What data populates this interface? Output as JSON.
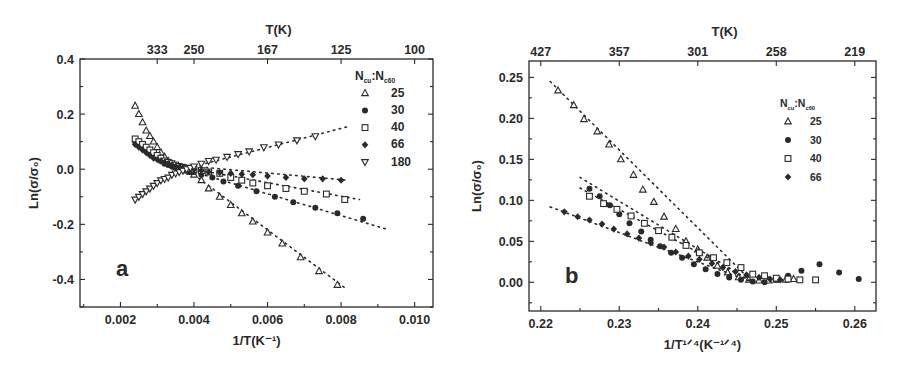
{
  "chart_data": [
    {
      "panel": "a",
      "type": "scatter",
      "panel_label": "a",
      "xlabel": "1/T(K⁻¹)",
      "ylabel": "Ln(σ/σ₀)",
      "top_axis_label": "T(K)",
      "xlim": [
        0.0009,
        0.0105
      ],
      "ylim": [
        -0.5,
        0.4
      ],
      "xticks": [
        0.002,
        0.004,
        0.006,
        0.008,
        0.01
      ],
      "xtick_labels": [
        "0.002",
        "0.004",
        "0.006",
        "0.008",
        "0.010"
      ],
      "yticks": [
        -0.4,
        -0.2,
        0.0,
        0.2,
        0.4
      ],
      "ytick_labels": [
        "-0.4",
        "-0.2",
        "0.0",
        "0.2",
        "0.4"
      ],
      "top_ticks": [
        0.003,
        0.004,
        0.006,
        0.008,
        0.01
      ],
      "top_tick_labels": [
        "333",
        "250",
        "167",
        "125",
        "100"
      ],
      "grid": false,
      "legend_title": "Nₑᵤ:Nₑ₆₀",
      "legend_position": "upper right",
      "series": [
        {
          "name": "25",
          "marker": "triangle-up-open",
          "x": [
            0.0024,
            0.0025,
            0.0026,
            0.0027,
            0.0028,
            0.0029,
            0.003,
            0.0031,
            0.0032,
            0.0033,
            0.0034,
            0.0035,
            0.0036,
            0.0037,
            0.0038,
            0.0039,
            0.004,
            0.0042,
            0.0044,
            0.0047,
            0.005,
            0.0053,
            0.0056,
            0.006,
            0.0064,
            0.0069,
            0.0074,
            0.0079
          ],
          "y": [
            0.23,
            0.2,
            0.17,
            0.14,
            0.12,
            0.1,
            0.08,
            0.06,
            0.045,
            0.03,
            0.02,
            0.01,
            0.005,
            0.0,
            -0.005,
            -0.01,
            -0.02,
            -0.04,
            -0.07,
            -0.1,
            -0.13,
            -0.16,
            -0.19,
            -0.23,
            -0.27,
            -0.32,
            -0.37,
            -0.42
          ],
          "fit_line": [
            [
              0.004,
              -0.02
            ],
            [
              0.0081,
              -0.43
            ]
          ]
        },
        {
          "name": "30",
          "marker": "circle-filled",
          "x": [
            0.0024,
            0.0025,
            0.0026,
            0.0027,
            0.0028,
            0.0029,
            0.003,
            0.0031,
            0.0032,
            0.0033,
            0.0034,
            0.0035,
            0.0036,
            0.0037,
            0.0038,
            0.0039,
            0.004,
            0.0042,
            0.0045,
            0.0048,
            0.0052,
            0.0057,
            0.0062,
            0.0067,
            0.0073,
            0.0079,
            0.0086
          ],
          "y": [
            0.1,
            0.09,
            0.08,
            0.07,
            0.06,
            0.05,
            0.04,
            0.03,
            0.02,
            0.015,
            0.01,
            0.005,
            0.0,
            -0.002,
            -0.005,
            -0.008,
            -0.01,
            -0.02,
            -0.03,
            -0.045,
            -0.06,
            -0.08,
            -0.1,
            -0.12,
            -0.14,
            -0.16,
            -0.18
          ],
          "fit_line": [
            [
              0.004,
              -0.01
            ],
            [
              0.0093,
              -0.22
            ]
          ]
        },
        {
          "name": "40",
          "marker": "square-open",
          "x": [
            0.0024,
            0.0025,
            0.0026,
            0.0027,
            0.0028,
            0.0029,
            0.003,
            0.0031,
            0.0032,
            0.0033,
            0.0034,
            0.0035,
            0.0036,
            0.0037,
            0.0038,
            0.0039,
            0.004,
            0.0042,
            0.0044,
            0.0047,
            0.005,
            0.0053,
            0.0056,
            0.006,
            0.0065,
            0.007,
            0.0076,
            0.0081
          ],
          "y": [
            0.11,
            0.1,
            0.09,
            0.08,
            0.07,
            0.06,
            0.05,
            0.04,
            0.03,
            0.025,
            0.02,
            0.015,
            0.01,
            0.007,
            0.004,
            0.002,
            0.0,
            -0.005,
            -0.01,
            -0.015,
            -0.03,
            -0.04,
            -0.05,
            -0.06,
            -0.07,
            -0.08,
            -0.09,
            -0.11
          ],
          "fit_line": [
            [
              0.004,
              0.0
            ],
            [
              0.0085,
              -0.11
            ]
          ]
        },
        {
          "name": "66",
          "marker": "diamond-filled",
          "x": [
            0.0024,
            0.0025,
            0.0026,
            0.0027,
            0.0028,
            0.0029,
            0.003,
            0.0031,
            0.0032,
            0.0033,
            0.0034,
            0.0035,
            0.0036,
            0.0037,
            0.0038,
            0.0039,
            0.004,
            0.0042,
            0.0044,
            0.0047,
            0.005,
            0.0053,
            0.0056,
            0.006,
            0.0065,
            0.007,
            0.0075,
            0.008
          ],
          "y": [
            0.09,
            0.08,
            0.07,
            0.06,
            0.05,
            0.04,
            0.035,
            0.03,
            0.025,
            0.02,
            0.015,
            0.01,
            0.008,
            0.006,
            0.004,
            0.002,
            0.0,
            -0.005,
            -0.01,
            -0.012,
            -0.015,
            -0.018,
            -0.02,
            -0.025,
            -0.03,
            -0.035,
            -0.035,
            -0.04
          ],
          "fit_line": [
            [
              0.004,
              0.01
            ],
            [
              0.0082,
              -0.04
            ]
          ]
        },
        {
          "name": "180",
          "marker": "triangle-down-open",
          "x": [
            0.0024,
            0.0025,
            0.0026,
            0.0027,
            0.0028,
            0.0029,
            0.003,
            0.0031,
            0.0032,
            0.0033,
            0.0034,
            0.0035,
            0.0036,
            0.0037,
            0.0038,
            0.0039,
            0.004,
            0.0042,
            0.0044,
            0.0046,
            0.0049,
            0.0052,
            0.0055,
            0.0059,
            0.0063,
            0.0068,
            0.0073
          ],
          "y": [
            -0.11,
            -0.1,
            -0.09,
            -0.08,
            -0.07,
            -0.06,
            -0.05,
            -0.04,
            -0.035,
            -0.03,
            -0.02,
            -0.015,
            -0.01,
            -0.005,
            0.0,
            0.005,
            0.01,
            0.02,
            0.03,
            0.035,
            0.045,
            0.055,
            0.065,
            0.08,
            0.09,
            0.105,
            0.12
          ],
          "fit_line": [
            [
              0.004,
              0.01
            ],
            [
              0.0082,
              0.155
            ]
          ]
        }
      ]
    },
    {
      "panel": "b",
      "type": "scatter",
      "panel_label": "b",
      "xlabel": "1/T¹ᐟ⁴(K⁻¹ᐟ⁴)",
      "ylabel": "Ln(σ/σ₀)",
      "top_axis_label": "T(K)",
      "xlim": [
        0.2185,
        0.2627
      ],
      "ylim": [
        -0.035,
        0.27
      ],
      "xticks": [
        0.22,
        0.23,
        0.24,
        0.25,
        0.26
      ],
      "xtick_labels": [
        "0.22",
        "0.23",
        "0.24",
        "0.25",
        "0.26"
      ],
      "yticks": [
        0.0,
        0.05,
        0.1,
        0.15,
        0.2,
        0.25
      ],
      "ytick_labels": [
        "0.00",
        "0.05",
        "0.10",
        "0.15",
        "0.20",
        "0.25"
      ],
      "top_ticks": [
        0.22,
        0.23,
        0.24,
        0.25,
        0.26
      ],
      "top_tick_labels": [
        "427",
        "357",
        "301",
        "258",
        "219"
      ],
      "grid": false,
      "legend_title": "Nₑᵤ:Nₑ₆₀",
      "legend_position": "upper right",
      "series": [
        {
          "name": "25",
          "marker": "triangle-up-open",
          "x": [
            0.2222,
            0.2242,
            0.2255,
            0.2272,
            0.2287,
            0.2302,
            0.2318,
            0.233,
            0.2344,
            0.2357,
            0.2372,
            0.2385,
            0.24,
            0.2412,
            0.2425,
            0.2438,
            0.2452,
            0.2465,
            0.2478,
            0.249,
            0.25,
            0.2512,
            0.2522
          ],
          "y": [
            0.234,
            0.216,
            0.199,
            0.184,
            0.168,
            0.15,
            0.131,
            0.113,
            0.098,
            0.08,
            0.065,
            0.05,
            0.04,
            0.03,
            0.02,
            0.012,
            0.006,
            0.003,
            0.002,
            0.002,
            0.003,
            0.003,
            0.004
          ],
          "fit_line": [
            [
              0.2212,
              0.245
            ],
            [
              0.247,
              0.0
            ]
          ]
        },
        {
          "name": "30",
          "marker": "circle-filled",
          "x": [
            0.2262,
            0.2275,
            0.2288,
            0.23,
            0.2313,
            0.2328,
            0.234,
            0.2352,
            0.2366,
            0.238,
            0.2395,
            0.241,
            0.2425,
            0.244,
            0.2455,
            0.247,
            0.2485,
            0.25,
            0.2515,
            0.2532,
            0.2555,
            0.258,
            0.2605
          ],
          "y": [
            0.114,
            0.105,
            0.094,
            0.083,
            0.072,
            0.062,
            0.052,
            0.044,
            0.036,
            0.03,
            0.022,
            0.016,
            0.01,
            0.006,
            0.003,
            0.001,
            0.0,
            0.003,
            0.008,
            0.014,
            0.022,
            0.012,
            0.004
          ],
          "fit_line": [
            [
              0.225,
              0.128
            ],
            [
              0.247,
              0.0
            ]
          ]
        },
        {
          "name": "40",
          "marker": "square-open",
          "x": [
            0.2262,
            0.228,
            0.2297,
            0.2315,
            0.2332,
            0.235,
            0.2367,
            0.2385,
            0.2402,
            0.242,
            0.2437,
            0.2455,
            0.247,
            0.2485,
            0.25,
            0.2515,
            0.253,
            0.255
          ],
          "y": [
            0.105,
            0.096,
            0.089,
            0.081,
            0.072,
            0.063,
            0.055,
            0.045,
            0.036,
            0.03,
            0.024,
            0.018,
            0.01,
            0.008,
            0.005,
            0.004,
            0.003,
            0.003
          ],
          "fit_line": [
            [
              0.225,
              0.115
            ],
            [
              0.247,
              0.0
            ]
          ]
        },
        {
          "name": "66",
          "marker": "diamond-filled",
          "x": [
            0.223,
            0.2247,
            0.2262,
            0.2278,
            0.2293,
            0.231,
            0.2325,
            0.234,
            0.2357,
            0.2372,
            0.2388,
            0.2402,
            0.2418,
            0.2432,
            0.2448,
            0.2462,
            0.2478,
            0.2492,
            0.2505
          ],
          "y": [
            0.086,
            0.08,
            0.076,
            0.071,
            0.065,
            0.059,
            0.054,
            0.048,
            0.043,
            0.037,
            0.032,
            0.028,
            0.023,
            0.018,
            0.013,
            0.009,
            0.006,
            0.004,
            0.003
          ],
          "fit_line": [
            [
              0.2212,
              0.092
            ],
            [
              0.247,
              0.0
            ]
          ]
        }
      ]
    }
  ],
  "figure": {
    "panel_a": {
      "frame": {
        "x0": 80,
        "y0": 59,
        "x1": 433,
        "y1": 307
      }
    },
    "panel_b": {
      "frame": {
        "x0": 529,
        "y0": 61,
        "x1": 876,
        "y1": 311
      }
    }
  }
}
